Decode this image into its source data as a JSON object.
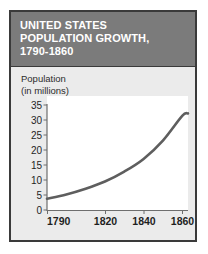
{
  "figure": {
    "title": "UNITED STATES\nPOPULATION GROWTH,\n1790-1860",
    "axis_label": "Population\n(in millions)",
    "border_color": "#3a3a3a",
    "title_band_color": "#7b7b7b",
    "body_background_color": "#ebebeb",
    "plot_background_color": "#ffffff",
    "curve_color": "#5e5e5e"
  },
  "chart_data": {
    "type": "line",
    "title": "UNITED STATES POPULATION GROWTH, 1790-1860",
    "xlabel": "",
    "ylabel": "Population (in millions)",
    "xlim": [
      1790,
      1863
    ],
    "ylim": [
      0,
      35
    ],
    "grid": false,
    "legend": null,
    "x_ticks": [
      1790,
      1820,
      1840,
      1860
    ],
    "x_tick_labels": [
      "1790",
      "1820",
      "1840",
      "1860"
    ],
    "y_ticks": [
      0,
      5,
      10,
      15,
      20,
      25,
      30,
      35
    ],
    "y_tick_labels": [
      "0",
      "5",
      "10",
      "15",
      "20",
      "25",
      "30",
      "35"
    ],
    "series": [
      {
        "name": "United States population",
        "x": [
          1790,
          1800,
          1810,
          1820,
          1830,
          1840,
          1850,
          1860,
          1863
        ],
        "values": [
          3.9,
          5.3,
          7.2,
          9.6,
          12.9,
          17.1,
          23.2,
          31.4,
          32.2
        ]
      }
    ]
  }
}
